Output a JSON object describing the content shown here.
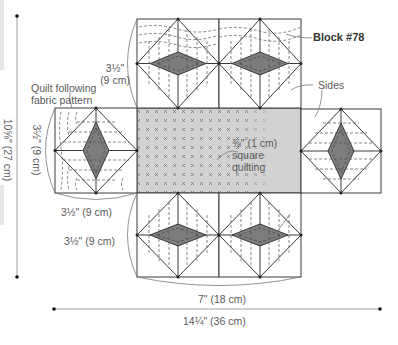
{
  "title": "Block #78",
  "labels": {
    "block_name": "Block #78",
    "sides": "Sides",
    "quilt_note_line1": "Quilt following",
    "quilt_note_line2": "fabric pattern",
    "square_quilting_line1": "⅜\" (1 cm)",
    "square_quilting_line2": "square",
    "square_quilting_line3": "quilting",
    "top_block_height_line1": "3½\"",
    "top_block_height_line2": "(9 cm)",
    "left_block_height": "3½\" (9 cm)",
    "left_block_width": "3½\" (9 cm)",
    "bottom_block_height": "3½\" (9 cm)",
    "bottom_width": "7\" (18 cm)",
    "total_width": "14¼\" (36 cm)",
    "total_height": "10⅝\" (27 cm)"
  },
  "colors": {
    "line": "#3a3a3a",
    "center_fill": "#d2d2d2",
    "diamond_fill": "#7d7d7d",
    "dim_line": "#888888",
    "text": "#5a5a5a"
  }
}
